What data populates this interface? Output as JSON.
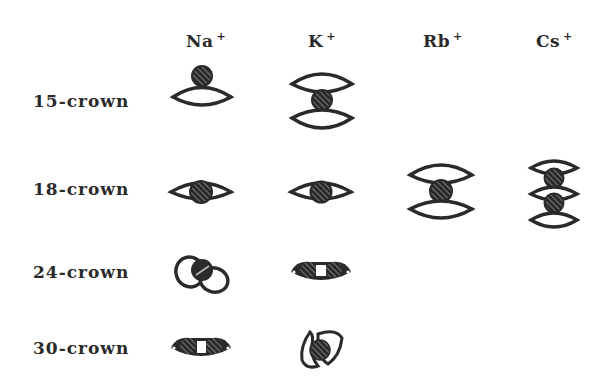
{
  "diagram": {
    "type": "complex-geometry-matrix",
    "columns": [
      {
        "ion": "Na",
        "charge": "+"
      },
      {
        "ion": "K",
        "charge": "+"
      },
      {
        "ion": "Rb",
        "charge": "+"
      },
      {
        "ion": "Cs",
        "charge": "+"
      }
    ],
    "rows": [
      {
        "label": "15-crown"
      },
      {
        "label": "18-crown"
      },
      {
        "label": "24-crown"
      },
      {
        "label": "30-crown"
      }
    ],
    "cells": [
      {
        "row": "15-crown",
        "col": "Na+",
        "shape": "perching"
      },
      {
        "row": "15-crown",
        "col": "K+",
        "shape": "sandwich"
      },
      {
        "row": "18-crown",
        "col": "Na+",
        "shape": "nesting"
      },
      {
        "row": "18-crown",
        "col": "K+",
        "shape": "nesting"
      },
      {
        "row": "18-crown",
        "col": "Rb+",
        "shape": "sandwich"
      },
      {
        "row": "18-crown",
        "col": "Cs+",
        "shape": "club-sandwich"
      },
      {
        "row": "24-crown",
        "col": "Na+",
        "shape": "wrapped"
      },
      {
        "row": "24-crown",
        "col": "K+",
        "shape": "binuclear"
      },
      {
        "row": "30-crown",
        "col": "Na+",
        "shape": "binuclear"
      },
      {
        "row": "30-crown",
        "col": "K+",
        "shape": "wrapped"
      }
    ],
    "colors": {
      "ink": "#2a2a2a",
      "background": "#ffffff",
      "hatch": "#8a8a8a"
    }
  }
}
